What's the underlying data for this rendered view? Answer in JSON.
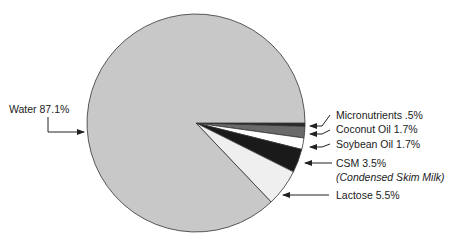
{
  "chart_data": {
    "type": "pie",
    "title": "",
    "slices": [
      {
        "label": "Water",
        "value": 87.1,
        "display": "Water 87.1%",
        "color": "#c8c8c8"
      },
      {
        "label": "Micronutrients",
        "value": 0.5,
        "display": "Micronutrients .5%",
        "color": "#2a2a2a"
      },
      {
        "label": "Coconut Oil",
        "value": 1.7,
        "display": "Coconut Oil 1.7%",
        "color": "#6a6a6a"
      },
      {
        "label": "Soybean Oil",
        "value": 1.7,
        "display": "Soybean Oil 1.7%",
        "color": "#ffffff"
      },
      {
        "label": "CSM",
        "value": 3.5,
        "display": "CSM 3.5%",
        "note": "(Condensed Skim Milk)",
        "color": "#1a1a1a"
      },
      {
        "label": "Lactose",
        "value": 5.5,
        "display": "Lactose 5.5%",
        "color": "#efefef"
      }
    ],
    "legend": "none (callout labels with arrows)"
  }
}
